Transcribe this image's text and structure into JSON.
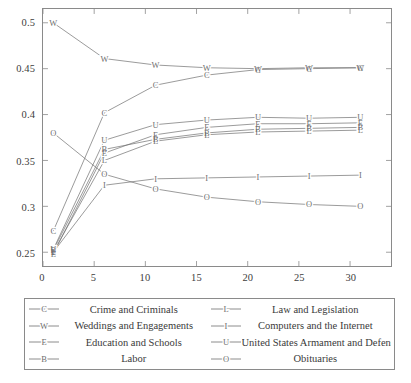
{
  "chart_data": {
    "type": "line",
    "title": "",
    "xlabel": "",
    "ylabel": "",
    "xlim": [
      0,
      34
    ],
    "ylim": [
      0.235,
      0.515
    ],
    "xticks": [
      0,
      5,
      10,
      15,
      20,
      25,
      30
    ],
    "yticks": [
      0.25,
      0.3,
      0.35,
      0.4,
      0.45,
      0.5
    ],
    "xtick_labels": [
      "0",
      "5",
      "10",
      "15",
      "20",
      "25",
      "30"
    ],
    "ytick_labels": [
      "0.25",
      "0.3",
      "0.35",
      "0.4",
      "0.45",
      "0.5"
    ],
    "grid": false,
    "legend_position": "below",
    "legend_columns": 2,
    "x": [
      1,
      6,
      11,
      16,
      21,
      26,
      31
    ],
    "series": [
      {
        "name": "Crime and Criminals",
        "marker": "C",
        "color": "#6e6e6e",
        "values": [
          0.273,
          0.402,
          0.432,
          0.443,
          0.449,
          0.45,
          0.451
        ]
      },
      {
        "name": "Weddings and Engagements",
        "marker": "W",
        "color": "#6e6e6e",
        "values": [
          0.5,
          0.461,
          0.454,
          0.451,
          0.45,
          0.451,
          0.451
        ]
      },
      {
        "name": "Education and Schools",
        "marker": "E",
        "color": "#6e6e6e",
        "values": [
          0.248,
          0.358,
          0.378,
          0.386,
          0.39,
          0.39,
          0.391
        ]
      },
      {
        "name": "Labor",
        "marker": "B",
        "color": "#6e6e6e",
        "values": [
          0.252,
          0.362,
          0.373,
          0.38,
          0.384,
          0.385,
          0.386
        ]
      },
      {
        "name": "Law and Legislation",
        "marker": "L",
        "color": "#6e6e6e",
        "values": [
          0.25,
          0.35,
          0.371,
          0.378,
          0.381,
          0.382,
          0.383
        ]
      },
      {
        "name": "Computers and the Internet",
        "marker": "I",
        "color": "#6e6e6e",
        "values": [
          0.25,
          0.323,
          0.33,
          0.331,
          0.332,
          0.333,
          0.334
        ]
      },
      {
        "name": "United States Armament and Defense",
        "marker": "U",
        "color": "#6e6e6e",
        "values": [
          0.253,
          0.372,
          0.389,
          0.394,
          0.397,
          0.396,
          0.397
        ]
      },
      {
        "name": "Obituaries",
        "marker": "O",
        "color": "#6e6e6e",
        "values": [
          0.38,
          0.335,
          0.319,
          0.31,
          0.305,
          0.302,
          0.3
        ]
      }
    ]
  },
  "legend": {
    "entries": [
      {
        "label": "Crime and Criminals",
        "marker": "C",
        "column": 0,
        "row": 0
      },
      {
        "label": "Law and Legislation",
        "marker": "L",
        "column": 1,
        "row": 0
      },
      {
        "label": "Weddings and Engagements",
        "marker": "W",
        "column": 0,
        "row": 1
      },
      {
        "label": "Computers and the Internet",
        "marker": "I",
        "column": 1,
        "row": 1
      },
      {
        "label": "Education and Schools",
        "marker": "E",
        "column": 0,
        "row": 2
      },
      {
        "label": "United States Armament and Defense",
        "marker": "U",
        "column": 1,
        "row": 2
      },
      {
        "label": "Labor",
        "marker": "B",
        "column": 0,
        "row": 3
      },
      {
        "label": "Obituaries",
        "marker": "O",
        "column": 1,
        "row": 3
      }
    ]
  },
  "colors": {
    "line": "#6e6e6e",
    "frame": "#8a8a8a",
    "text": "#3a3a3a",
    "background": "#ffffff"
  }
}
